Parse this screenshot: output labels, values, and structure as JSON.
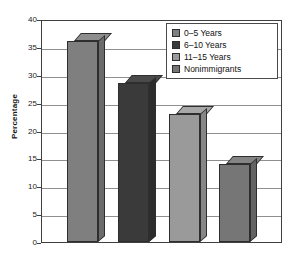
{
  "chart_data": {
    "type": "bar",
    "title": "",
    "subtitle": "",
    "xlabel": "",
    "ylabel": "Percentage",
    "categories": [
      "0–5 Years",
      "6–10 Years",
      "11–15 Years",
      "Nonimmigrants"
    ],
    "values": [
      36,
      28.5,
      23,
      14
    ],
    "ylim": [
      0,
      40
    ],
    "ytick_labels": [
      "40",
      "35",
      "30",
      "25",
      "20",
      "15",
      "10",
      "5",
      "0"
    ],
    "ytick_values": [
      40,
      35,
      30,
      25,
      20,
      15,
      10,
      5,
      0
    ],
    "xtick_labels": [],
    "grid": true,
    "legend_position": "top-right",
    "legend_entries": [
      {
        "label": "0–5 Years",
        "color": "#7f7f7f"
      },
      {
        "label": "6–10 Years",
        "color": "#3a3a3a"
      },
      {
        "label": "11–15 Years",
        "color": "#9a9a9a"
      },
      {
        "label": "Nonimmigrants",
        "color": "#767676"
      }
    ],
    "bar_colors": [
      "#7f7f7f",
      "#3a3a3a",
      "#9a9a9a",
      "#767676"
    ],
    "bar_top_colors": [
      "#8d8d8d",
      "#4a4a4a",
      "#a8a8a8",
      "#848484"
    ],
    "bar_side_colors": [
      "#6b6b6b",
      "#2c2c2c",
      "#868686",
      "#636363"
    ],
    "axis_color": "#3f3f3f",
    "gridline_color": "#8f8f8f",
    "background_color": "#ffffff"
  }
}
